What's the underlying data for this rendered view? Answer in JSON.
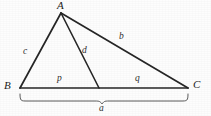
{
  "figure": {
    "type": "geometry-diagram",
    "background_color": "#fdfdfd",
    "stroke_color": "#262626",
    "label_color": "#2b2b2b",
    "vertices": {
      "A": {
        "label": "A",
        "x": 61,
        "y": 13,
        "label_x": 58,
        "label_y": 1
      },
      "B": {
        "label": "B",
        "x": 20,
        "y": 88,
        "label_x": 5,
        "label_y": 80
      },
      "C": {
        "label": "C",
        "x": 188,
        "y": 88,
        "label_x": 193,
        "label_y": 80
      },
      "D": {
        "label": "",
        "x": 99,
        "y": 88,
        "label_x": 0,
        "label_y": 0
      }
    },
    "segments": [
      {
        "name": "side-c",
        "label": "c",
        "from": "B",
        "to": "A",
        "label_x": 24,
        "label_y": 47
      },
      {
        "name": "side-b",
        "label": "b",
        "from": "A",
        "to": "C",
        "label_x": 120,
        "label_y": 32
      },
      {
        "name": "cevian-d",
        "label": "d",
        "from": "A",
        "to": "D",
        "label_x": 83,
        "label_y": 46
      },
      {
        "name": "base-p",
        "label": "p",
        "from": "B",
        "to": "D",
        "label_x": 58,
        "label_y": 74
      },
      {
        "name": "base-q",
        "label": "q",
        "from": "D",
        "to": "C",
        "label_x": 136,
        "label_y": 74
      }
    ],
    "brace": {
      "name": "base-brace",
      "label": "a",
      "from_x": 20,
      "to_x": 188,
      "top_y": 94,
      "bottom_y": 103,
      "center_x": 102,
      "label_x": 99,
      "label_y": 104
    }
  }
}
